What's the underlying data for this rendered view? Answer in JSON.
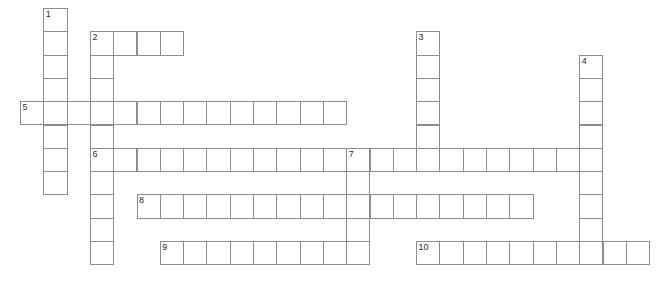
{
  "puzzle": {
    "title": "Crossword Grid",
    "grid": {
      "origin_x": 20,
      "origin_y": 8,
      "cell_size": 23.3,
      "cell_border_color": "#8e8e8e",
      "cell_fill_color": "#ffffff",
      "background_color": "#ffffff",
      "number_color": "#2b2b2b"
    },
    "entries": [
      {
        "number": "1",
        "direction": "down",
        "col": 1,
        "row": 0,
        "length": 8
      },
      {
        "number": "2",
        "direction": "across",
        "col": 3,
        "row": 1,
        "length": 4
      },
      {
        "number": "2",
        "direction": "down",
        "col": 3,
        "row": 1,
        "length": 10,
        "show_number": false
      },
      {
        "number": "3",
        "direction": "down",
        "col": 17,
        "row": 1,
        "length": 6
      },
      {
        "number": "4",
        "direction": "down",
        "col": 24,
        "row": 2,
        "length": 8
      },
      {
        "number": "5",
        "direction": "across",
        "col": 0,
        "row": 4,
        "length": 14
      },
      {
        "number": "6",
        "direction": "across",
        "col": 3,
        "row": 6,
        "length": 22
      },
      {
        "number": "7",
        "direction": "down",
        "col": 14,
        "row": 6,
        "length": 5
      },
      {
        "number": "8",
        "direction": "across",
        "col": 5,
        "row": 8,
        "length": 17
      },
      {
        "number": "9",
        "direction": "across",
        "col": 6,
        "row": 10,
        "length": 8
      },
      {
        "number": "10",
        "direction": "across",
        "col": 17,
        "row": 10,
        "length": 10
      }
    ],
    "clue_numbers": [
      "1",
      "2",
      "3",
      "4",
      "5",
      "6",
      "7",
      "8",
      "9",
      "10"
    ]
  }
}
